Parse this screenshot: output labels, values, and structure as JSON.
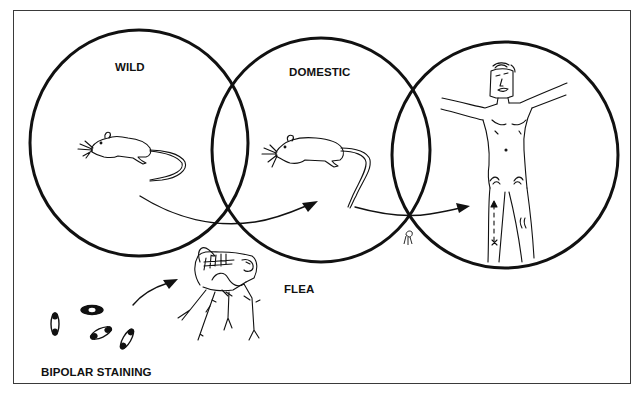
{
  "diagram": {
    "labels": {
      "wild": "WILD",
      "domestic": "DOMESTIC",
      "flea": "FLEA",
      "bipolar_staining": "BIPOLAR STAINING"
    },
    "nodes": [
      {
        "id": "wild",
        "label": "WILD",
        "content": "wild rodent"
      },
      {
        "id": "domestic",
        "label": "DOMESTIC",
        "content": "domestic rat"
      },
      {
        "id": "human",
        "label": "",
        "content": "human figure with bubo on leg"
      }
    ],
    "edges": [
      {
        "from": "wild",
        "to": "domestic",
        "style": "curved-arrow"
      },
      {
        "from": "domestic",
        "to": "human",
        "style": "curved-arrow"
      },
      {
        "from": "bipolar_staining",
        "to": "flea",
        "style": "curved-arrow"
      }
    ],
    "colors": {
      "ink": "#111111",
      "background": "#ffffff",
      "frame": "#3a3a3a"
    }
  }
}
